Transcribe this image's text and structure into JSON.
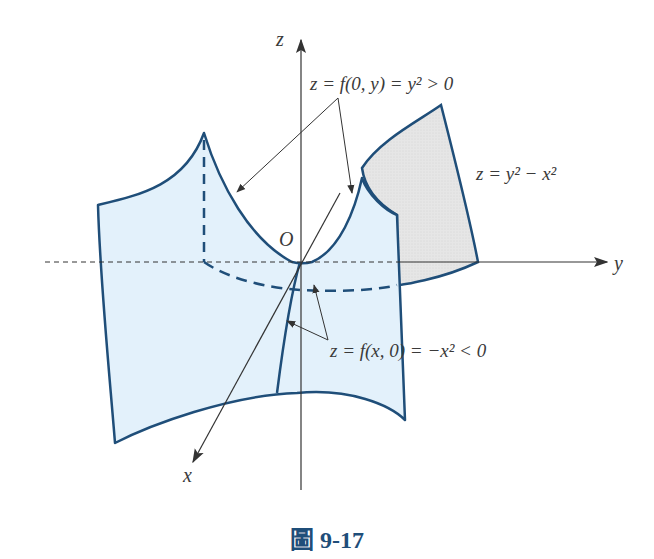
{
  "figure": {
    "caption": "圖 9-17",
    "surface_equation": "z = y² − x²",
    "annotation_yz_trace": "z = f(0, y) = y² > 0",
    "annotation_xz_trace": "z = f(x, 0) = −x² < 0",
    "origin_label": "O",
    "axes": {
      "x": "x",
      "y": "y",
      "z": "z"
    },
    "colors": {
      "surface_fill": "#e3f1fb",
      "surface_edge": "#1f4e79",
      "shadow_fill": "#e4e4e4",
      "axis": "#333333",
      "caption": "#1f4e79"
    }
  }
}
